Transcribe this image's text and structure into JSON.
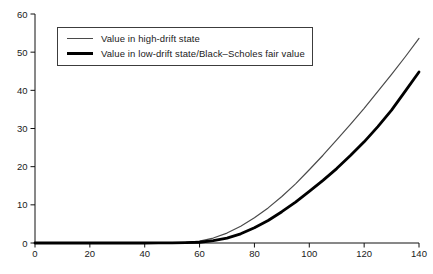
{
  "figure": {
    "background": "#ffffff",
    "axis_color": "#111111",
    "tick_label_color": "#1a1a1a"
  },
  "chart_data": {
    "type": "line",
    "title": "",
    "xlabel": "",
    "ylabel": "",
    "xlim": [
      0,
      140
    ],
    "ylim": [
      0,
      60
    ],
    "x_ticks": [
      0,
      20,
      40,
      60,
      80,
      100,
      120,
      140
    ],
    "y_ticks": [
      0,
      10,
      20,
      30,
      40,
      50,
      60
    ],
    "grid": false,
    "legend_position": "upper-left",
    "x": [
      0,
      5,
      10,
      15,
      20,
      25,
      30,
      35,
      40,
      45,
      50,
      55,
      60,
      65,
      70,
      75,
      80,
      85,
      90,
      95,
      100,
      105,
      110,
      115,
      120,
      125,
      130,
      135,
      140
    ],
    "series": [
      {
        "name": "Value in high-drift state",
        "color": "#4a4a4a",
        "line_width": 1.2,
        "values": [
          0,
          0,
          0,
          0,
          0,
          0,
          0,
          0,
          0,
          0.02,
          0.08,
          0.2,
          0.5,
          1.3,
          2.6,
          4.4,
          6.6,
          9.2,
          12.2,
          15.5,
          19.2,
          23.0,
          27.0,
          31.1,
          35.3,
          39.7,
          44.2,
          48.8,
          53.6
        ]
      },
      {
        "name": "Value in low-drift state/Black–Scholes fair value",
        "color": "#000000",
        "line_width": 2.8,
        "values": [
          0,
          0,
          0,
          0,
          0,
          0,
          0,
          0,
          0,
          0.01,
          0.03,
          0.08,
          0.2,
          0.6,
          1.3,
          2.4,
          4.0,
          5.9,
          8.2,
          10.7,
          13.5,
          16.4,
          19.5,
          22.9,
          26.5,
          30.5,
          34.8,
          39.8,
          44.8
        ]
      }
    ]
  }
}
